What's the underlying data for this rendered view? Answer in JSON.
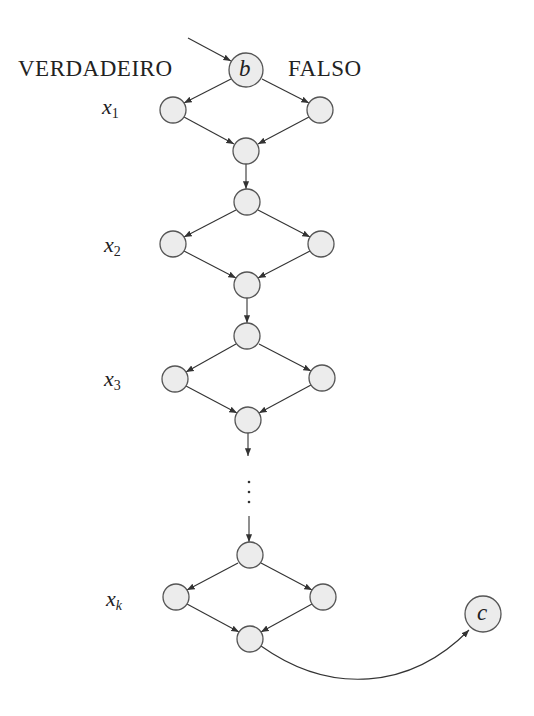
{
  "labels": {
    "true_branch": "VERDADEIRO",
    "false_branch": "FALSO",
    "start_node": "b",
    "end_node": "c",
    "levels": [
      {
        "var": "x",
        "sub": "1"
      },
      {
        "var": "x",
        "sub": "2"
      },
      {
        "var": "x",
        "sub": "3"
      },
      {
        "var": "x",
        "sub": "k"
      }
    ],
    "ellipsis": "⋮"
  },
  "colors": {
    "node_fill": "#ececec",
    "node_stroke": "#555555",
    "edge": "#333333"
  }
}
